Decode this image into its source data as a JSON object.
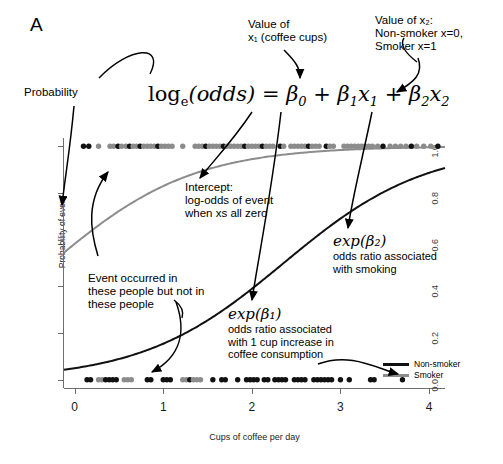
{
  "panel": {
    "label": "A"
  },
  "equation": {
    "text": "log_e(odds) = β0 + β1x1 + β2x2",
    "lhs": "log",
    "lhs_sub": "e",
    "lhs_arg": "(odds)",
    "eq": "=",
    "terms": [
      "β₀",
      "β₁x₁",
      "β₂x₂"
    ]
  },
  "annotations": {
    "probability": "Probability",
    "value_x1": "Value of\nx₁ (coffee cups)",
    "value_x2": "Value of x₂:\nNon-smoker x=0,\nSmoker x=1",
    "intercept": "Intercept:\nlog-odds of event\nwhen xs all zero",
    "event_occurred": "Event occurred in\nthese people but not in\nthese people",
    "exp_b1_math": "exp(β₁)",
    "exp_b1_text": "odds ratio associated\nwith 1 cup increase in\ncoffee consumption",
    "exp_b2_math": "exp(β₂)",
    "exp_b2_text": "odds ratio associated\nwith smoking"
  },
  "legend": {
    "position": "bottom-right",
    "items": [
      {
        "label": "Non-smoker",
        "color": "#111111"
      },
      {
        "label": "Smoker",
        "color": "#8c8c8c"
      }
    ]
  },
  "chart_data": {
    "type": "line",
    "title": "",
    "xlabel": "Cups of coffee per day",
    "ylabel": "Probability of event",
    "xlim": [
      -0.12,
      4.18
    ],
    "ylim": [
      -0.035,
      1.035
    ],
    "xticks": [
      "0",
      "1",
      "2",
      "3",
      "4"
    ],
    "xtick_values": [
      0,
      1,
      2,
      3,
      4
    ],
    "yticks": [
      "0.0",
      "0.2",
      "0.4",
      "0.6",
      "0.8",
      "1.0"
    ],
    "ytick_values": [
      0.0,
      0.2,
      0.4,
      0.6,
      0.8,
      1.0
    ],
    "grid": false,
    "series": [
      {
        "name": "Non-smoker",
        "color": "#111111",
        "model": "logistic",
        "beta0": -2.95,
        "beta1": 1.25,
        "x": [
          0,
          0.25,
          0.5,
          0.75,
          1.0,
          1.25,
          1.5,
          1.75,
          2.0,
          2.25,
          2.5,
          2.75,
          3.0,
          3.25,
          3.5,
          3.75,
          4.0
        ],
        "y": [
          0.05,
          0.065,
          0.087,
          0.115,
          0.152,
          0.197,
          0.252,
          0.317,
          0.389,
          0.466,
          0.545,
          0.621,
          0.691,
          0.753,
          0.806,
          0.85,
          0.885
        ]
      },
      {
        "name": "Smoker",
        "color": "#8c8c8c",
        "model": "logistic",
        "beta0": 0.33,
        "beta1": 1.25,
        "x": [
          0,
          0.25,
          0.5,
          0.75,
          1.0,
          1.25,
          1.5,
          1.75,
          2.0,
          2.25,
          2.5,
          2.75,
          3.0,
          3.25,
          3.5,
          3.75,
          4.0
        ],
        "y": [
          0.582,
          0.654,
          0.72,
          0.778,
          0.826,
          0.865,
          0.897,
          0.921,
          0.94,
          0.955,
          0.966,
          0.974,
          0.98,
          0.985,
          0.989,
          0.991,
          0.993
        ]
      }
    ],
    "rug_top": {
      "label": "event occurred (y = 1.0)",
      "y": 1.0,
      "points": [
        {
          "x": 0.1,
          "g": "n"
        },
        {
          "x": 0.16,
          "g": "n"
        },
        {
          "x": 0.27,
          "g": "s"
        },
        {
          "x": 0.4,
          "g": "s"
        },
        {
          "x": 0.44,
          "g": "s"
        },
        {
          "x": 0.49,
          "g": "n"
        },
        {
          "x": 0.53,
          "g": "s"
        },
        {
          "x": 0.58,
          "g": "s"
        },
        {
          "x": 0.62,
          "g": "n"
        },
        {
          "x": 0.66,
          "g": "s"
        },
        {
          "x": 0.7,
          "g": "s"
        },
        {
          "x": 0.74,
          "g": "n"
        },
        {
          "x": 0.78,
          "g": "s"
        },
        {
          "x": 0.82,
          "g": "s"
        },
        {
          "x": 0.86,
          "g": "s"
        },
        {
          "x": 0.9,
          "g": "s"
        },
        {
          "x": 0.94,
          "g": "n"
        },
        {
          "x": 0.98,
          "g": "s"
        },
        {
          "x": 1.02,
          "g": "s"
        },
        {
          "x": 1.06,
          "g": "s"
        },
        {
          "x": 1.1,
          "g": "s"
        },
        {
          "x": 1.22,
          "g": "s"
        },
        {
          "x": 1.36,
          "g": "s"
        },
        {
          "x": 1.4,
          "g": "s"
        },
        {
          "x": 1.44,
          "g": "s"
        },
        {
          "x": 1.48,
          "g": "n"
        },
        {
          "x": 1.52,
          "g": "s"
        },
        {
          "x": 1.56,
          "g": "s"
        },
        {
          "x": 1.6,
          "g": "s"
        },
        {
          "x": 1.64,
          "g": "s"
        },
        {
          "x": 1.68,
          "g": "n"
        },
        {
          "x": 1.72,
          "g": "s"
        },
        {
          "x": 1.76,
          "g": "s"
        },
        {
          "x": 1.8,
          "g": "s"
        },
        {
          "x": 1.84,
          "g": "s"
        },
        {
          "x": 1.88,
          "g": "s"
        },
        {
          "x": 1.92,
          "g": "n"
        },
        {
          "x": 1.96,
          "g": "s"
        },
        {
          "x": 2.0,
          "g": "s"
        },
        {
          "x": 2.04,
          "g": "s"
        },
        {
          "x": 2.08,
          "g": "s"
        },
        {
          "x": 2.12,
          "g": "n"
        },
        {
          "x": 2.16,
          "g": "s"
        },
        {
          "x": 2.2,
          "g": "s"
        },
        {
          "x": 2.24,
          "g": "s"
        },
        {
          "x": 2.32,
          "g": "n"
        },
        {
          "x": 2.36,
          "g": "s"
        },
        {
          "x": 2.44,
          "g": "s"
        },
        {
          "x": 2.48,
          "g": "s"
        },
        {
          "x": 2.52,
          "g": "s"
        },
        {
          "x": 2.56,
          "g": "s"
        },
        {
          "x": 2.6,
          "g": "s"
        },
        {
          "x": 2.64,
          "g": "n"
        },
        {
          "x": 2.68,
          "g": "s"
        },
        {
          "x": 2.72,
          "g": "s"
        },
        {
          "x": 2.76,
          "g": "s"
        },
        {
          "x": 2.84,
          "g": "n"
        },
        {
          "x": 2.88,
          "g": "s"
        },
        {
          "x": 2.92,
          "g": "s"
        },
        {
          "x": 3.04,
          "g": "s"
        },
        {
          "x": 3.08,
          "g": "s"
        },
        {
          "x": 3.12,
          "g": "s"
        },
        {
          "x": 3.16,
          "g": "s"
        },
        {
          "x": 3.2,
          "g": "s"
        },
        {
          "x": 3.24,
          "g": "s"
        },
        {
          "x": 3.28,
          "g": "s"
        },
        {
          "x": 3.32,
          "g": "s"
        },
        {
          "x": 3.36,
          "g": "s"
        },
        {
          "x": 3.42,
          "g": "s"
        },
        {
          "x": 3.48,
          "g": "n"
        },
        {
          "x": 3.56,
          "g": "s"
        },
        {
          "x": 3.62,
          "g": "s"
        },
        {
          "x": 3.68,
          "g": "s"
        },
        {
          "x": 3.74,
          "g": "s"
        },
        {
          "x": 3.8,
          "g": "n"
        },
        {
          "x": 3.86,
          "g": "s"
        },
        {
          "x": 3.94,
          "g": "s"
        },
        {
          "x": 4.02,
          "g": "s"
        },
        {
          "x": 4.1,
          "g": "n"
        }
      ]
    },
    "rug_bottom": {
      "label": "event did not occur (y = 0.0)",
      "y": 0.0,
      "points": [
        {
          "x": 0.14,
          "g": "n"
        },
        {
          "x": 0.18,
          "g": "n"
        },
        {
          "x": 0.27,
          "g": "s"
        },
        {
          "x": 0.31,
          "g": "s"
        },
        {
          "x": 0.35,
          "g": "n"
        },
        {
          "x": 0.39,
          "g": "n"
        },
        {
          "x": 0.43,
          "g": "n"
        },
        {
          "x": 0.47,
          "g": "n"
        },
        {
          "x": 0.56,
          "g": "s"
        },
        {
          "x": 0.6,
          "g": "s"
        },
        {
          "x": 0.64,
          "g": "s"
        },
        {
          "x": 0.82,
          "g": "n"
        },
        {
          "x": 0.86,
          "g": "n"
        },
        {
          "x": 1.0,
          "g": "n"
        },
        {
          "x": 1.04,
          "g": "n"
        },
        {
          "x": 1.08,
          "g": "n"
        },
        {
          "x": 1.22,
          "g": "s"
        },
        {
          "x": 1.26,
          "g": "s"
        },
        {
          "x": 1.3,
          "g": "n"
        },
        {
          "x": 1.34,
          "g": "s"
        },
        {
          "x": 1.38,
          "g": "s"
        },
        {
          "x": 1.42,
          "g": "s"
        },
        {
          "x": 1.56,
          "g": "n"
        },
        {
          "x": 1.66,
          "g": "n"
        },
        {
          "x": 1.7,
          "g": "n"
        },
        {
          "x": 1.84,
          "g": "n"
        },
        {
          "x": 1.94,
          "g": "n"
        },
        {
          "x": 1.98,
          "g": "n"
        },
        {
          "x": 2.02,
          "g": "n"
        },
        {
          "x": 2.06,
          "g": "n"
        },
        {
          "x": 2.14,
          "g": "n"
        },
        {
          "x": 2.18,
          "g": "n"
        },
        {
          "x": 2.26,
          "g": "n"
        },
        {
          "x": 2.3,
          "g": "n"
        },
        {
          "x": 2.34,
          "g": "n"
        },
        {
          "x": 2.38,
          "g": "n"
        },
        {
          "x": 2.48,
          "g": "n"
        },
        {
          "x": 2.52,
          "g": "n"
        },
        {
          "x": 2.56,
          "g": "n"
        },
        {
          "x": 2.6,
          "g": "n"
        },
        {
          "x": 2.7,
          "g": "n"
        },
        {
          "x": 2.74,
          "g": "n"
        },
        {
          "x": 2.78,
          "g": "n"
        },
        {
          "x": 2.82,
          "g": "n"
        },
        {
          "x": 2.86,
          "g": "n"
        },
        {
          "x": 2.9,
          "g": "n"
        },
        {
          "x": 3.0,
          "g": "n"
        },
        {
          "x": 3.1,
          "g": "n"
        },
        {
          "x": 3.34,
          "g": "n"
        },
        {
          "x": 3.38,
          "g": "n"
        },
        {
          "x": 3.7,
          "g": "n"
        }
      ]
    }
  }
}
